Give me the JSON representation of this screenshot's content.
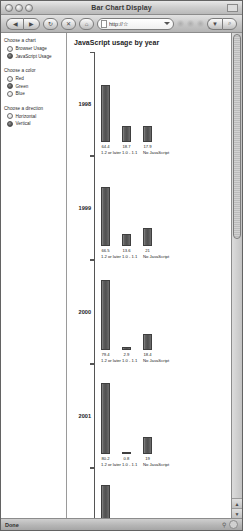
{
  "window": {
    "title": "Bar Chart Display",
    "traffic_lights": [
      "close",
      "minimize",
      "zoom"
    ]
  },
  "toolbar": {
    "back_label": "◀",
    "forward_label": "▶",
    "reload_label": "↻",
    "stop_label": "✕",
    "home_label": "⌂",
    "address_value": "http://☆",
    "search_icon_label": "▼",
    "go_label": "⌕"
  },
  "sidebar": {
    "groups": [
      {
        "label": "Choose a chart",
        "options": [
          {
            "label": "Browser Usage",
            "selected": false
          },
          {
            "label": "JavaScript Usage",
            "selected": true
          }
        ]
      },
      {
        "label": "Choose a color",
        "options": [
          {
            "label": "Red",
            "selected": false
          },
          {
            "label": "Green",
            "selected": true
          },
          {
            "label": "Blue",
            "selected": false
          }
        ]
      },
      {
        "label": "Choose a direction",
        "options": [
          {
            "label": "Horizontal",
            "selected": false
          },
          {
            "label": "Vertical",
            "selected": true
          }
        ]
      }
    ]
  },
  "statusbar": {
    "text": "Done"
  },
  "scrollbar": {
    "up_arrow": "▲",
    "down_arrow": "▼"
  },
  "chart_data": {
    "type": "bar",
    "title": "JavaScript usage by year",
    "xlabel": "",
    "ylabel": "",
    "ylim": [
      0,
      100
    ],
    "grid": false,
    "legend": "none",
    "categories": [
      "1.2 or later",
      "1.0 - 1.1",
      "No JavaScript"
    ],
    "groups": [
      {
        "year": "1998",
        "values": [
          64.4,
          18.7,
          17.9
        ]
      },
      {
        "year": "1999",
        "values": [
          66.5,
          13.6,
          21.0
        ]
      },
      {
        "year": "2000",
        "values": [
          79.4,
          2.9,
          18.4
        ]
      },
      {
        "year": "2001",
        "values": [
          80.2,
          0.8,
          19.0
        ]
      },
      {
        "year": "2002",
        "values": [
          83.0,
          0.4,
          16.6
        ]
      }
    ]
  }
}
